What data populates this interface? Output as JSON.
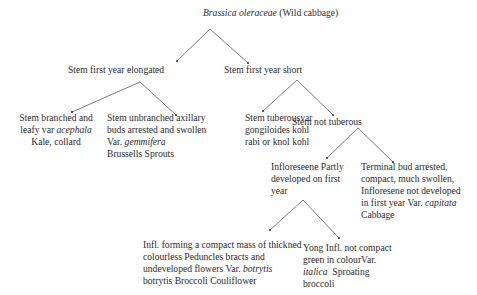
{
  "diagram": {
    "type": "classification-tree",
    "root": {
      "italic": "Brassica oleraceae",
      "text": " (Wild cabbage)"
    },
    "nodes": {
      "elongated": "Stem first year elongated",
      "short": "Stem first year short",
      "kale": {
        "l1": "Stem branched and",
        "l2a": "leafy var ",
        "l2i": "acephala",
        "l3": "Kale, collard"
      },
      "brussels": {
        "l1": "Stem unbranched axillary",
        "l2": "buds arrested and swollen",
        "l3a": "Var. ",
        "l3i": "gemmifera",
        "l4": "Brussells Sprouts"
      },
      "tuberous": {
        "l1": "Stem tuberousvar",
        "l2": "gongiloides kohl",
        "l3": "rabi or knol kohl"
      },
      "not_tuberous": "Stem not tuberous",
      "infl_partly": {
        "l1": "Infloreseene Partly",
        "l2": "developed on first",
        "l3": "year"
      },
      "terminal_bud": {
        "l1": "Terminal bud arrested,",
        "l2": "compact, much swollen,",
        "l3": "Infloresene not developed",
        "l4a": "in first year Var. ",
        "l4i": "capitata",
        "l5": "Cabbage"
      },
      "cauliflower": {
        "l1": "Infl. forming a compact mass of thickned",
        "l2": "colourless Peduncles bracts and",
        "l3a": "undeveloped flowers Var. ",
        "l3i": "botrytis",
        "l4": "botrytis Broccoli Couliflower"
      },
      "broccoli": {
        "l1": "Yong Infl. not compact",
        "l2": "green in colourVar.",
        "l3i": "italica",
        "l3a": "  Sproating",
        "l4": "broccoli"
      }
    },
    "colors": {
      "text": "#2a2a2a",
      "line": "#555555",
      "background": "#ffffff"
    }
  }
}
